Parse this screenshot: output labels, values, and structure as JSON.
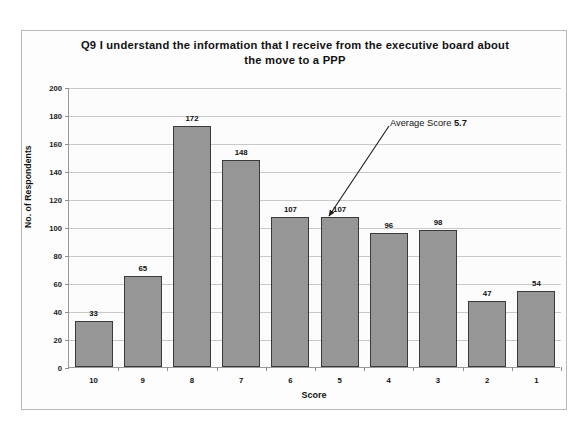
{
  "chart_data": {
    "type": "bar",
    "title": "Q9 I understand the information that I receive from the executive board about the move to a PPP",
    "title_line1": "Q9 I understand the information that I receive from the executive board about",
    "title_line2": "the move to a PPP",
    "xlabel": "Score",
    "ylabel": "No. of Respondents",
    "categories": [
      "10",
      "9",
      "8",
      "7",
      "6",
      "5",
      "4",
      "3",
      "2",
      "1"
    ],
    "values": [
      33,
      65,
      172,
      148,
      107,
      107,
      96,
      98,
      47,
      54
    ],
    "ylim": [
      0,
      200
    ],
    "yticks": [
      0,
      20,
      40,
      60,
      80,
      100,
      120,
      140,
      160,
      180,
      200
    ],
    "ytick_labels": [
      "0",
      "20",
      "40",
      "60",
      "80",
      "100",
      "120",
      "140",
      "160",
      "180",
      "200"
    ],
    "grid": true,
    "legend": false,
    "bar_color": "#969696",
    "bar_border_color": "#3a3a3a",
    "gridline_color": "#c9c9c9",
    "axis_color": "#9a9a9a",
    "background_color": "#fcfcfc",
    "annotations": [
      {
        "label_prefix": "Average Score ",
        "label_value": "5.7",
        "points_to_category": "5"
      }
    ]
  }
}
